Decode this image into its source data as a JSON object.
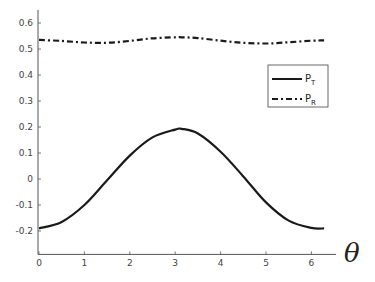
{
  "chart_data": {
    "type": "line",
    "title": "",
    "xlabel": "θ",
    "ylabel": "",
    "xlim": [
      0,
      6.5
    ],
    "ylim": [
      -0.29,
      0.65
    ],
    "xticks": [
      0,
      1,
      2,
      3,
      4,
      5,
      6
    ],
    "yticks": [
      -0.2,
      -0.1,
      0,
      0.1,
      0.2,
      0.3,
      0.4,
      0.5,
      0.6
    ],
    "grid": false,
    "legend_position": "upper right",
    "x": [
      0,
      0.5,
      1.0,
      1.5,
      2.0,
      2.5,
      3.0,
      3.14,
      3.5,
      4.0,
      4.5,
      5.0,
      5.5,
      6.0,
      6.28
    ],
    "series": [
      {
        "name": "P_T",
        "label_main": "P",
        "label_sub": "T",
        "style": "solid",
        "values": [
          -0.19,
          -0.165,
          -0.1,
          -0.005,
          0.09,
          0.16,
          0.19,
          0.193,
          0.175,
          0.105,
          0.01,
          -0.09,
          -0.16,
          -0.188,
          -0.19
        ]
      },
      {
        "name": "P_R",
        "label_main": "P",
        "label_sub": "R",
        "style": "dash-dot",
        "values": [
          0.535,
          0.531,
          0.525,
          0.524,
          0.531,
          0.541,
          0.545,
          0.545,
          0.542,
          0.532,
          0.524,
          0.521,
          0.526,
          0.532,
          0.533
        ]
      }
    ]
  },
  "colors": {
    "line": "#1a1a1a",
    "axis": "#555555",
    "background": "#ffffff"
  }
}
